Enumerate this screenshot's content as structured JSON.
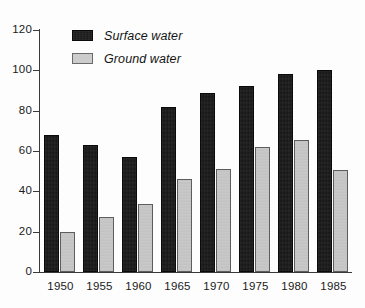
{
  "chart_data": {
    "type": "bar",
    "title": "",
    "xlabel": "",
    "ylabel": "",
    "ylim": [
      0,
      120
    ],
    "yticks": [
      0,
      20,
      40,
      60,
      80,
      100,
      120
    ],
    "ytick_labels": [
      "0",
      "20",
      "40",
      "60",
      "80",
      "100",
      "120"
    ],
    "grid": false,
    "legend_position": "top-left-inside",
    "categories": [
      "1950",
      "1955",
      "1960",
      "1965",
      "1970",
      "1975",
      "1980",
      "1985"
    ],
    "series": [
      {
        "name": "Surface water",
        "color": "#141414",
        "values": [
          68,
          63,
          57,
          82,
          89,
          92,
          98,
          100
        ]
      },
      {
        "name": "Ground water",
        "color": "#c9c9c9",
        "values": [
          20,
          27.5,
          33.5,
          46,
          51,
          62,
          65.5,
          50.5
        ]
      }
    ]
  },
  "legend": {
    "items": [
      {
        "label": "Surface water",
        "swatch": "dark-swatch"
      },
      {
        "label": "Ground water",
        "swatch": "light-swatch"
      }
    ]
  }
}
